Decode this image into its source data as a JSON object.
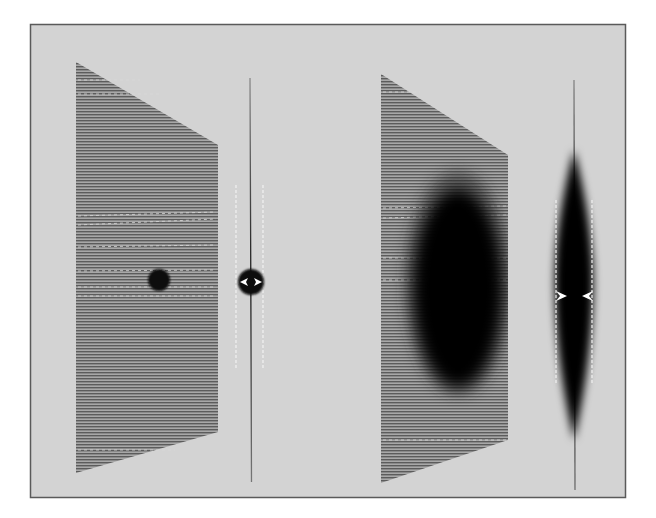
{
  "figure": {
    "frame": {
      "background": "#d3d3d3",
      "border": "#5a5a5a"
    },
    "panels": [
      {
        "id": "left",
        "plane": {
          "corners": [
            [
              76,
              62
            ],
            [
              218,
              145
            ],
            [
              218,
              432
            ],
            [
              76,
              473
            ]
          ],
          "fill": "#8a8a8a"
        },
        "spot": {
          "shape": "circle",
          "cx": 159,
          "cy": 280,
          "r": 11,
          "color": "#0a0a0a"
        },
        "edge_view": {
          "line": {
            "x": 250,
            "y1": 78,
            "y2": 482
          },
          "bulge": {
            "cx": 250,
            "cy": 282,
            "r": 13
          },
          "guides": [
            {
              "x": 236,
              "y1": 185,
              "y2": 370
            },
            {
              "x": 263,
              "y1": 185,
              "y2": 370
            }
          ],
          "arrows": {
            "y": 282,
            "direction": "outward"
          }
        }
      },
      {
        "id": "right",
        "plane": {
          "corners": [
            [
              381,
              74
            ],
            [
              508,
              155
            ],
            [
              508,
              440
            ],
            [
              381,
              483
            ]
          ],
          "fill": "#8a8a8a"
        },
        "spot": {
          "shape": "ellipse",
          "cx": 458,
          "cy": 288,
          "rx": 44,
          "ry": 98,
          "color": "#0a0a0a",
          "blurred": true
        },
        "edge_view": {
          "line": {
            "x": 574,
            "y1": 80,
            "y2": 490
          },
          "spindle": {
            "cx": 574,
            "cy": 293,
            "rx": 19,
            "ry": 115
          },
          "guides": [
            {
              "x": 556,
              "y1": 200,
              "y2": 385
            },
            {
              "x": 592,
              "y1": 200,
              "y2": 385
            }
          ],
          "arrows": {
            "y": 296,
            "direction": "inward"
          }
        }
      }
    ]
  }
}
